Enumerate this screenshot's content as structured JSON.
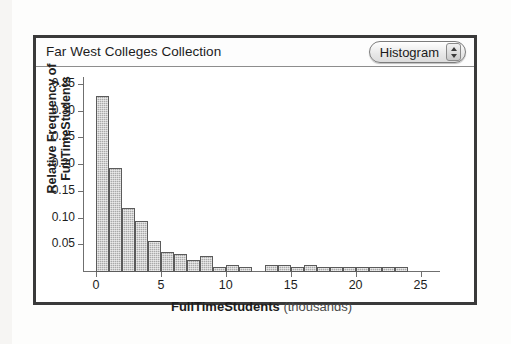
{
  "window": {
    "title": "Far West Colleges Collection",
    "view_popup": {
      "label": "Histogram",
      "stepper_up_icon": "triangle-up-icon",
      "stepper_down_icon": "triangle-down-icon"
    }
  },
  "chart_data": {
    "type": "bar",
    "title": "Far West Colleges Collection",
    "xlabel_bold": "FullTimeStudents",
    "xlabel_light": "(thousands)",
    "ylabel_line1": "Relative Frequency of",
    "ylabel_line2": "FullTimeStudents",
    "xlim": [
      -1,
      26.5
    ],
    "ylim": [
      0,
      0.365
    ],
    "grid": false,
    "legend": null,
    "bin_width": 1,
    "x_ticks": [
      0,
      5,
      10,
      15,
      20,
      25
    ],
    "x_tick_labels": [
      "0",
      "5",
      "10",
      "15",
      "20",
      "25"
    ],
    "y_ticks": [
      0.05,
      0.1,
      0.15,
      0.2,
      0.25,
      0.3,
      0.35
    ],
    "y_tick_labels": [
      "0.05",
      "0.10",
      "0.15",
      "0.20",
      "0.25",
      "0.30",
      "0.35"
    ],
    "bins": [
      {
        "x0": 0,
        "x1": 1,
        "value": 0.33
      },
      {
        "x0": 1,
        "x1": 2,
        "value": 0.195
      },
      {
        "x0": 2,
        "x1": 3,
        "value": 0.12
      },
      {
        "x0": 3,
        "x1": 4,
        "value": 0.095
      },
      {
        "x0": 4,
        "x1": 5,
        "value": 0.058
      },
      {
        "x0": 5,
        "x1": 6,
        "value": 0.038
      },
      {
        "x0": 6,
        "x1": 7,
        "value": 0.034
      },
      {
        "x0": 7,
        "x1": 8,
        "value": 0.022
      },
      {
        "x0": 8,
        "x1": 9,
        "value": 0.03
      },
      {
        "x0": 9,
        "x1": 10,
        "value": 0.009
      },
      {
        "x0": 10,
        "x1": 11,
        "value": 0.013
      },
      {
        "x0": 11,
        "x1": 12,
        "value": 0.009
      },
      {
        "x0": 12,
        "x1": 13,
        "value": 0.0
      },
      {
        "x0": 13,
        "x1": 14,
        "value": 0.013
      },
      {
        "x0": 14,
        "x1": 15,
        "value": 0.013
      },
      {
        "x0": 15,
        "x1": 16,
        "value": 0.009
      },
      {
        "x0": 16,
        "x1": 17,
        "value": 0.013
      },
      {
        "x0": 17,
        "x1": 18,
        "value": 0.009
      },
      {
        "x0": 18,
        "x1": 19,
        "value": 0.009
      },
      {
        "x0": 19,
        "x1": 20,
        "value": 0.009
      },
      {
        "x0": 20,
        "x1": 21,
        "value": 0.009
      },
      {
        "x0": 21,
        "x1": 22,
        "value": 0.009
      },
      {
        "x0": 22,
        "x1": 23,
        "value": 0.009
      },
      {
        "x0": 23,
        "x1": 24,
        "value": 0.009
      }
    ],
    "bar_fill": "#a9a9a9",
    "bar_edge": "#5b5b5b"
  }
}
